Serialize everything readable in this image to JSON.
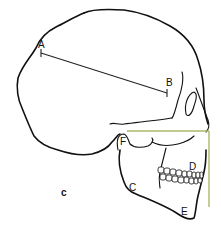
{
  "figure": {
    "panel_label": "c",
    "landmarks": [
      {
        "id": "A",
        "label": "A"
      },
      {
        "id": "B",
        "label": "B"
      },
      {
        "id": "C",
        "label": "C"
      },
      {
        "id": "D",
        "label": "D"
      },
      {
        "id": "E",
        "label": "E"
      },
      {
        "id": "F",
        "label": "F"
      }
    ],
    "measurement_line": {
      "from": "A",
      "to": "B"
    },
    "reference_line_color": "#a8b86a",
    "outline_color": "#111111"
  }
}
